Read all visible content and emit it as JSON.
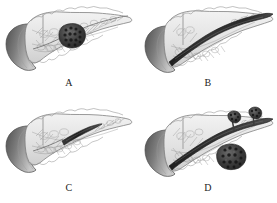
{
  "figure": {
    "kind": "medical-illustration",
    "style": "grayscale pencil engraving",
    "background_color": "#ffffff",
    "grid": {
      "rows": 2,
      "columns": 2
    },
    "panels": [
      {
        "id": "A",
        "label": "A",
        "subject": "pancreas with duodenum",
        "finding": "solid tumor mass in pancreatic neck/body, non-dilated main duct",
        "duct_state": "normal",
        "mass_count": 1,
        "mass_position": "body"
      },
      {
        "id": "B",
        "label": "B",
        "subject": "pancreas with duodenum",
        "finding": "diffuse dilatation of the main pancreatic duct along entire length",
        "duct_state": "diffusely dilated",
        "mass_count": 0,
        "mass_position": "none"
      },
      {
        "id": "C",
        "label": "C",
        "subject": "pancreas with duodenum",
        "finding": "segmental / focal dilatation of main pancreatic duct in body and tail",
        "duct_state": "segmentally dilated",
        "mass_count": 0,
        "mass_position": "none"
      },
      {
        "id": "D",
        "label": "D",
        "subject": "pancreas with duodenum",
        "finding": "dilated main duct with branch-duct cystic nodules and solid mass",
        "duct_state": "dilated with branch duct lesions",
        "mass_count": 3,
        "mass_position": "body and tail branch ducts"
      }
    ],
    "anatomy_labels": {
      "duodenum": "duodenum",
      "pancreas_head": "pancreatic head",
      "pancreas_body": "pancreatic body",
      "pancreas_tail": "pancreatic tail",
      "main_duct": "main pancreatic duct",
      "branch_ducts": "branch ducts",
      "tumor": "tumor mass"
    },
    "colors": {
      "background": "#ffffff",
      "outline": "#6e6e6e",
      "parenchyma_light": "#e9e9e9",
      "parenchyma_mid": "#c9c9c9",
      "duodenum_dark": "#5c5c5c",
      "duodenum_mid": "#8e8e8e",
      "duodenum_light": "#c2c2c2",
      "duct_dark": "#2b2b2b",
      "duct_mid": "#545454",
      "tumor_dark": "#2f2f2f",
      "label_text": "#1d1d1d"
    }
  }
}
